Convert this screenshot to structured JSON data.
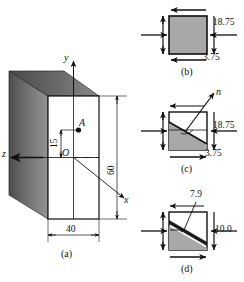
{
  "figure": {
    "panels": [
      {
        "id": "a",
        "caption": "(a)",
        "type": "block-3d"
      },
      {
        "id": "b",
        "caption": "(b)",
        "type": "stress-square"
      },
      {
        "id": "c",
        "caption": "(c)",
        "type": "inclined-plane"
      },
      {
        "id": "d",
        "caption": "(d)",
        "type": "resolved-stresses"
      }
    ]
  },
  "panel_a": {
    "caption": "(a)",
    "axis_y": "y",
    "axis_x": "x",
    "axis_z": "z",
    "point_label": "A",
    "origin_label": "O",
    "dim_height": "60",
    "dim_width": "40",
    "dim_offset": "15"
  },
  "panel_b": {
    "caption": "(b)",
    "stress_normal": "18.75",
    "stress_shear": "3.75"
  },
  "panel_c": {
    "caption": "(c)",
    "normal_label": "n",
    "stress_normal": "18.75",
    "stress_shear": "3.75"
  },
  "panel_d": {
    "caption": "(d)",
    "stress_shear": "7.9",
    "stress_normal": "10.0"
  },
  "colors": {
    "fill_gray": "#a8a8a8",
    "face_dark": "#5a5a5a",
    "face_top": "#6e6e6e",
    "outline": "#101010",
    "background": "#ffffff"
  }
}
